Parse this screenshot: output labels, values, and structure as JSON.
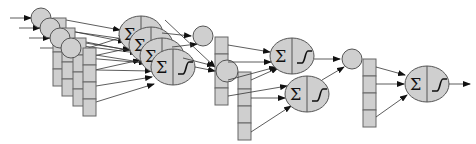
{
  "diagram": {
    "title": "",
    "type": "neural-network-multi-stage",
    "colors": {
      "node_fill": "#cfcfcf",
      "stroke": "#555555",
      "edge": "#333333",
      "background": "#ffffff"
    },
    "neuron_labels": {
      "sum_symbol": "Σ",
      "activation": "sigmoid"
    },
    "stages": [
      {
        "name": "input-layer",
        "circles": 4,
        "weight_vectors": 4,
        "cells_per_vector": 4
      },
      {
        "name": "hidden-layer-1",
        "neurons": 4,
        "outputs": 2,
        "weight_vectors": 2,
        "cells_per_vector": 4
      },
      {
        "name": "hidden-layer-2",
        "neurons": 2,
        "outputs": 1,
        "weight_vectors": 1,
        "cells_per_vector": 4
      },
      {
        "name": "output-layer",
        "neurons": 1
      }
    ]
  }
}
